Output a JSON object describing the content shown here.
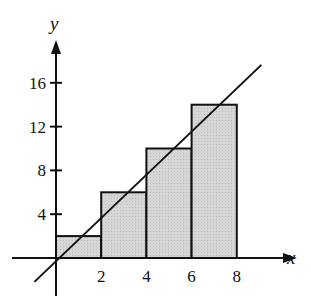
{
  "chart_data": {
    "type": "bar",
    "title": "",
    "xlabel": "x",
    "ylabel": "y",
    "x_ticks": [
      "2",
      "4",
      "6",
      "8"
    ],
    "y_ticks": [
      "4",
      "8",
      "12",
      "16"
    ],
    "xlim": [
      -1,
      9
    ],
    "ylim": [
      -2,
      18
    ],
    "bars": [
      {
        "x0": 0,
        "x1": 2,
        "height": 2
      },
      {
        "x0": 2,
        "x1": 4,
        "height": 6
      },
      {
        "x0": 4,
        "x1": 6,
        "height": 10
      },
      {
        "x0": 6,
        "x1": 8,
        "height": 14
      }
    ],
    "line": {
      "equation": "y = 2x",
      "x": [
        -1,
        9
      ],
      "y": [
        -2,
        18
      ]
    },
    "bar_fill": "#d4d4d4",
    "stroke": "#111111",
    "grid": false,
    "legend": null
  }
}
